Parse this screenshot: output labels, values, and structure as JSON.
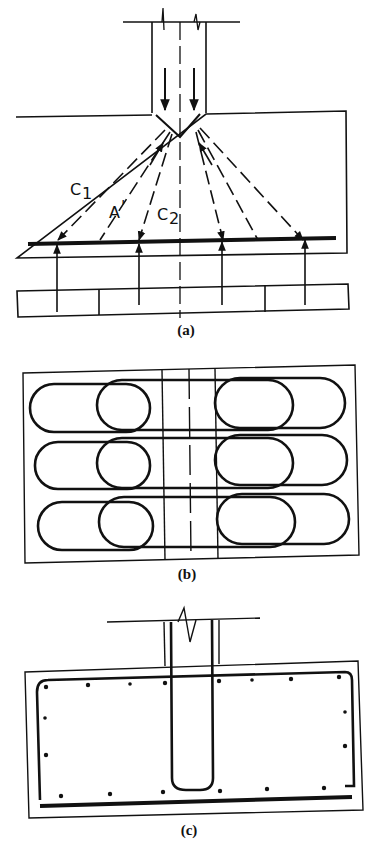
{
  "figure": {
    "panels": [
      {
        "id": "a",
        "caption": "(a)",
        "description": "Strut-and-tie model of a pile cap: column load spreads via compression struts to tie bar over piles",
        "labels": {
          "c1": "C",
          "c1_sub": "1",
          "a": "A",
          "a_mark": "'",
          "c2": "C",
          "c2_sub": "2"
        }
      },
      {
        "id": "b",
        "caption": "(b)",
        "description": "Plan view of looped reinforcement bars in three rows across the pile cap"
      },
      {
        "id": "c",
        "caption": "(c)",
        "description": "Section of pile cap showing perimeter reinforcement, distributed bars and U-shaped column starter bars"
      }
    ],
    "colors": {
      "ink": "#111111",
      "background": "#ffffff"
    }
  }
}
